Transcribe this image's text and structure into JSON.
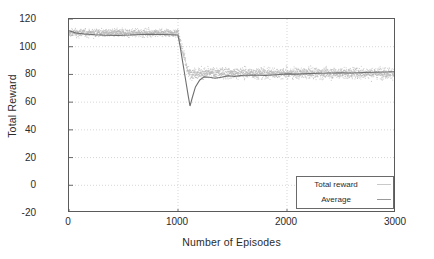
{
  "chart_data": {
    "type": "scatter",
    "title": "",
    "xlabel": "Number of Episodes",
    "ylabel": "Total Reward",
    "xlim": [
      0,
      3000
    ],
    "ylim": [
      -20,
      120
    ],
    "xticks": [
      0,
      1000,
      2000,
      3000
    ],
    "yticks": [
      -20,
      0,
      20,
      40,
      60,
      80,
      100,
      120
    ],
    "xtick_labels": [
      "0",
      "1000",
      "2000",
      "3000"
    ],
    "ytick_labels": [
      "-20",
      "0",
      "20",
      "40",
      "60",
      "80",
      "100",
      "120"
    ],
    "grid": true,
    "legend_position": "lower right",
    "legend": [
      "Total reward",
      "Average"
    ],
    "colors": {
      "scatter": "#b5b5b5",
      "average": "#6e6e6e",
      "grid": "#cccccc",
      "frame": "#5a5a5a"
    },
    "series": [
      {
        "name": "Total reward",
        "type": "scatter",
        "description": "Per-episode total reward, noisy cloud of points. Phase 1 (episodes 0-1000) centered near 110 spanning roughly 100 to 118. At episode 1000 the environment changes and rewards collapse. Phase 2 (episodes 1000-3000) centered near 81 spanning roughly 68 to 94.",
        "phase1_range_episodes": [
          0,
          1000
        ],
        "phase1_mean": 110,
        "phase1_spread": [
          100,
          118
        ],
        "phase2_range_episodes": [
          1000,
          3000
        ],
        "phase2_mean": 81,
        "phase2_spread": [
          68,
          94
        ]
      },
      {
        "name": "Average",
        "type": "line",
        "description": "Running average of total reward. Flat near 110 until episode 1000, drops sharply to a minimum of about 57 near episode 1100, recovers to about 78 and settles at roughly 81 through episode 3000.",
        "x": [
          0,
          60,
          140,
          240,
          340,
          450,
          560,
          660,
          760,
          860,
          940,
          990,
          1000,
          1020,
          1045,
          1070,
          1095,
          1110,
          1130,
          1160,
          1200,
          1240,
          1290,
          1340,
          1400,
          1460,
          1520,
          1600,
          1700,
          1800,
          1900,
          2000,
          2100,
          2200,
          2300,
          2400,
          2500,
          2600,
          2700,
          2800,
          2900,
          3000
        ],
        "y": [
          111.5,
          110.0,
          109.2,
          108.6,
          108.3,
          108.2,
          108.4,
          108.8,
          109.0,
          108.8,
          108.6,
          108.5,
          108.4,
          100.0,
          88.0,
          76.0,
          64.0,
          57.2,
          63.0,
          71.0,
          76.0,
          78.2,
          78.0,
          77.2,
          78.0,
          79.0,
          78.6,
          79.4,
          79.6,
          79.2,
          79.8,
          80.4,
          80.2,
          80.6,
          80.8,
          81.0,
          81.2,
          81.0,
          81.4,
          81.6,
          81.8,
          82.0
        ]
      }
    ],
    "annotations": [
      {
        "text": "Sharp performance drop at episode 1000",
        "x": 1000,
        "y": 57
      }
    ]
  }
}
